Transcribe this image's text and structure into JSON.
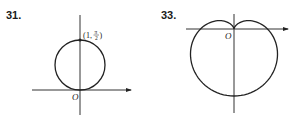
{
  "figures": [
    {
      "number": "31.",
      "curve": "circle",
      "origin_label": "O",
      "point_label": {
        "open": "(",
        "r": "1",
        "comma": ",",
        "theta_num": "π",
        "theta_den": "2",
        "close": ")"
      },
      "geometry": {
        "origin": [
          80,
          90
        ],
        "circle_center": [
          80,
          65
        ],
        "radius": 25,
        "x_axis": [
          32,
          131
        ],
        "y_axis": [
          15,
          115
        ]
      }
    },
    {
      "number": "33.",
      "curve": "cardioid",
      "origin_label": "O",
      "geometry": {
        "origin": [
          234,
          29
        ],
        "a": 33.5,
        "x_axis": [
          186,
          288
        ],
        "y_axis": [
          14,
          113
        ]
      }
    }
  ],
  "colors": {
    "ink": "#222222",
    "background": "#ffffff"
  }
}
